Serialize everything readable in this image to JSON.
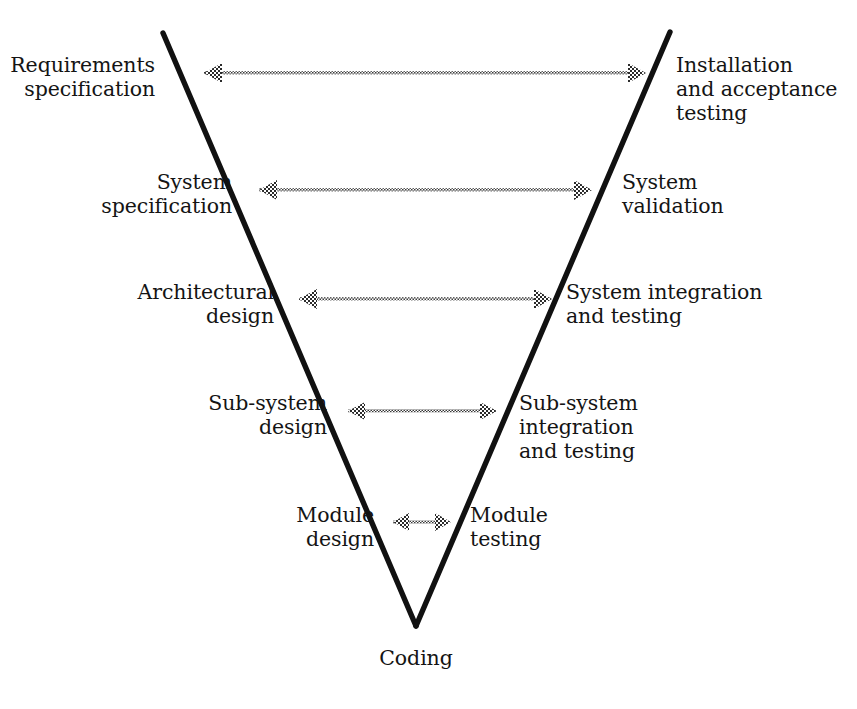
{
  "diagram": {
    "type": "v-model",
    "line_color": "#111111",
    "arrow_color": "#555555",
    "background_color": "#ffffff",
    "vertex_label": "Coding",
    "left_branch_name": "verification-specification-design",
    "right_branch_name": "validation-testing",
    "rows": [
      {
        "index": 1,
        "left_label": "Requirements\nspecification",
        "right_label": "Installation\nand acceptance\ntesting",
        "arrow": "double-headed-dotted",
        "arrow_y": 73,
        "arrow_x_start": 186,
        "arrow_x_end": 646
      },
      {
        "index": 2,
        "left_label": "System\nspecification",
        "right_label": "System\nvalidation",
        "arrow": "double-headed-dotted",
        "arrow_y": 190,
        "arrow_x_start": 241,
        "arrow_x_end": 592
      },
      {
        "index": 3,
        "left_label": "Architectural\ndesign",
        "right_label": "System integration\nand testing",
        "arrow": "double-headed-dotted",
        "arrow_y": 299,
        "arrow_x_start": 281,
        "arrow_x_end": 552
      },
      {
        "index": 4,
        "left_label": "Sub-system\ndesign",
        "right_label": "Sub-system\nintegration\nand testing",
        "arrow": "double-headed-dotted",
        "arrow_y": 411,
        "arrow_x_start": 331,
        "arrow_x_end": 497
      },
      {
        "index": 5,
        "left_label": "Module\ndesign",
        "right_label": "Module\ntesting",
        "arrow": "double-headed-dotted",
        "arrow_y": 522,
        "arrow_x_start": 378,
        "arrow_x_end": 451
      }
    ],
    "geometry": {
      "left_top_x": 163,
      "left_top_y": 33,
      "right_top_x": 670,
      "right_top_y": 32,
      "vertex_x": 416,
      "vertex_y": 626,
      "stroke_width": 5.2
    }
  }
}
